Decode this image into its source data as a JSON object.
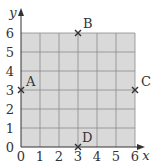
{
  "chart_data": {
    "type": "scatter",
    "title": "",
    "xlabel": "x",
    "ylabel": "y",
    "xlim": [
      0,
      6
    ],
    "ylim": [
      0,
      6
    ],
    "grid": true,
    "x_ticks": [
      "0",
      "1",
      "2",
      "3",
      "4",
      "5",
      "6"
    ],
    "y_ticks": [
      "0",
      "1",
      "2",
      "3",
      "4",
      "5",
      "6"
    ],
    "points": [
      {
        "label": "A",
        "x": 0,
        "y": 3
      },
      {
        "label": "B",
        "x": 3,
        "y": 6
      },
      {
        "label": "C",
        "x": 6,
        "y": 3
      },
      {
        "label": "D",
        "x": 3,
        "y": 0
      }
    ],
    "marker": "x"
  },
  "colors": {
    "grid_fill": "#d9d9d9",
    "grid_line": "#8a8a8a",
    "axis": "#333333",
    "marker": "#333333"
  }
}
